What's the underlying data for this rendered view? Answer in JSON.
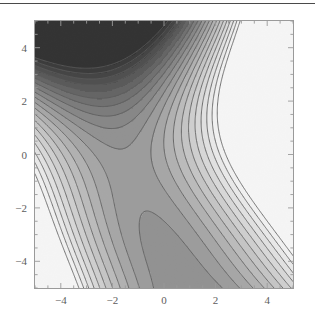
{
  "figure": {
    "kind": "contour-plot",
    "background_color": "#ffffff",
    "top_rule_color": "#4a4a4a",
    "frame_color": "#9a9a9a",
    "contour_line_color": "#5a5a5a",
    "tick_label_color": "#5d5d5d"
  },
  "chart_data": {
    "type": "heatmap",
    "title": "",
    "subtitle": "",
    "xlabel": "",
    "ylabel": "",
    "xlim": [
      -5,
      5
    ],
    "ylim": [
      -5,
      5
    ],
    "grid": false,
    "legend": "none",
    "colormap": "grayscale",
    "shading": "filled-contours",
    "xticks": [
      -4,
      -2,
      0,
      2,
      4
    ],
    "xtick_labels": [
      "-4",
      "-2",
      "0",
      "2",
      "4"
    ],
    "yticks": [
      -4,
      -2,
      0,
      2,
      4
    ],
    "ytick_labels": [
      "-4",
      "-2",
      "0",
      "2",
      "4"
    ],
    "minor_tick_step": 0.5,
    "contour_levels": [
      -5,
      -4,
      -3,
      -2,
      -1,
      0,
      1,
      2,
      3,
      4,
      5,
      6,
      7,
      8,
      9,
      10,
      11,
      12,
      13,
      14
    ],
    "level_fill_colors": [
      "#2f2f2f",
      "#383838",
      "#424242",
      "#4d4d4d",
      "#585858",
      "#646464",
      "#707070",
      "#7c7c7c",
      "#888888",
      "#939393",
      "#9e9e9e",
      "#a9a9a9",
      "#b4b4b4",
      "#bfbfbf",
      "#c9c9c9",
      "#d3d3d3",
      "#dddddd",
      "#e6e6e6",
      "#efefef",
      "#f7f7f7",
      "#fcfcfc"
    ],
    "value_min": -5.4,
    "value_max": 14.0,
    "features": [
      {
        "name": "minimum",
        "x": -5.0,
        "y": 5.0,
        "value": -5.4,
        "appearance": "dark-corner-basin"
      },
      {
        "name": "maximum",
        "x": 5.0,
        "y": 5.0,
        "value": 14.0,
        "appearance": "light-corner-peak"
      },
      {
        "name": "maximum",
        "x": 5.0,
        "y": -5.0,
        "value": 13.2,
        "appearance": "light-corner-peak"
      },
      {
        "name": "local-extremum",
        "x": -5.0,
        "y": -2.1,
        "value": 3.6,
        "appearance": "nested-closed-contours"
      },
      {
        "name": "saddle",
        "x": -0.5,
        "y": -1.6,
        "value": 6.0,
        "appearance": "saddle-crossing"
      },
      {
        "name": "saddle",
        "x": 0.2,
        "y": 0.4,
        "value": 6.4,
        "appearance": "saddle-crossing"
      }
    ],
    "samples_x": [
      -5,
      -4.5,
      -4,
      -3.5,
      -3,
      -2.5,
      -2,
      -1.5,
      -1,
      -0.5,
      0,
      0.5,
      1,
      1.5,
      2,
      2.5,
      3,
      3.5,
      4,
      4.5,
      5
    ],
    "samples_y": [
      -5,
      -4.5,
      -4,
      -3.5,
      -3,
      -2.5,
      -2,
      -1.5,
      -1,
      -0.5,
      0,
      0.5,
      1,
      1.5,
      2,
      2.5,
      3,
      3.5,
      4,
      4.5,
      5
    ]
  },
  "plot_geometry": {
    "left_px": 35,
    "top_px": 21,
    "width_px": 258,
    "height_px": 267
  }
}
